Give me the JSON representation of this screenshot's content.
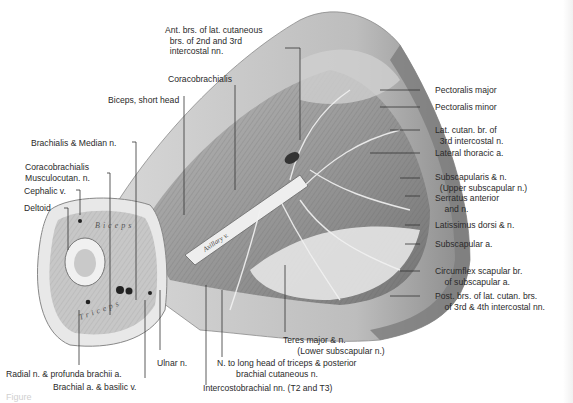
{
  "figure": {
    "caption_fragment": "Figure",
    "vessel_inscription": "Axillary v.",
    "section_inscription_upper": "Biceps",
    "section_inscription_lower": "Triceps",
    "labels": {
      "ant_brs": "Ant. brs. of lat. cutaneous\n  brs. of 2nd and 3rd\n  intercostal nn.",
      "coracobrachialis_top": "Coracobrachialis",
      "biceps_short": "Biceps, short head",
      "brachialis_median": "Brachialis & Median n.",
      "coraco_musculo": "Coracobrachialis\nMusculocutan. n.",
      "cephalic": "Cephalic v.",
      "deltoid": "Deltoid",
      "pect_major": "Pectoralis major",
      "pect_minor": "Pectoralis minor",
      "lat_cutan": "Lat. cutan. br. of\n  3rd intercostal n.",
      "lat_thoracic": "Lateral thoracic a.",
      "subscapularis": "Subscapularis & n.\n  (Upper subscapular n.)",
      "serratus": "Serratus anterior\n    and n.",
      "latissimus": "Latissimus dorsi & n.",
      "subscap_a": "Subscapular a.",
      "circumflex": "Circumflex scapular br.\n    of subscapular a.",
      "post_brs": "Post. brs. of lat. cutan. brs.\n    of 3rd & 4th intercostal nn.",
      "teres": "Teres major & n.\n      (Lower subscapular n.)",
      "n_long_head": "N. to long head of triceps & posterior\n        brachial cutaneous n.",
      "intercostobrachial": "Intercostobrachial nn. (T2 and T3)",
      "ulnar": "Ulnar n.",
      "radial": "Radial n. & profunda brachii a.",
      "brachial": "Brachial a. & basilic v."
    }
  }
}
